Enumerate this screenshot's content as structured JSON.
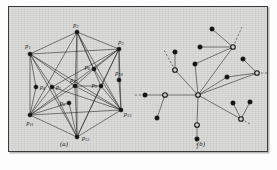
{
  "figure": {
    "background_color": "#fdfdfd",
    "plate_color": "#d4d4d2",
    "border_color": "#3a3a3a",
    "ink_color": "#141414",
    "panels": [
      {
        "id": "a",
        "caption": "(a)",
        "caption_x": 55,
        "caption_y": 139
      },
      {
        "id": "b",
        "caption": "(b)",
        "caption_x": 192,
        "caption_y": 139
      }
    ]
  },
  "chart_data": {
    "type": "diagram-graph",
    "title": "",
    "subtitle": "",
    "panels": [
      {
        "id": "a",
        "caption": "(a)",
        "description": "planar point set with complete-like visibility graph on thirteen labeled points",
        "node_count": 13,
        "node_style": "filled",
        "nodes": [
          {
            "id": "p1",
            "label": "p",
            "sub": "1",
            "x": 21,
            "y": 47,
            "label_dx": -2,
            "label_dy": -6,
            "anchor": "middle"
          },
          {
            "id": "p2",
            "label": "p",
            "sub": "2",
            "x": 68,
            "y": 25,
            "label_dx": -1,
            "label_dy": -5,
            "anchor": "middle"
          },
          {
            "id": "p3",
            "label": "p",
            "sub": "3",
            "x": 110,
            "y": 42,
            "label_dx": 2,
            "label_dy": -5,
            "anchor": "middle"
          },
          {
            "id": "p4",
            "label": "p",
            "sub": "4",
            "x": 27,
            "y": 80,
            "label_dx": 4,
            "label_dy": 2,
            "anchor": "start"
          },
          {
            "id": "p5",
            "label": "p",
            "sub": "5",
            "x": 43,
            "y": 80,
            "label_dx": 4,
            "label_dy": 2,
            "anchor": "start"
          },
          {
            "id": "p6",
            "label": "p",
            "sub": "6",
            "x": 60,
            "y": 96,
            "label_dx": -4,
            "label_dy": 2,
            "anchor": "end"
          },
          {
            "id": "p7",
            "label": "p",
            "sub": "7",
            "x": 66,
            "y": 79,
            "label_dx": -2,
            "label_dy": -4,
            "anchor": "middle"
          },
          {
            "id": "p8",
            "label": "p",
            "sub": "8",
            "x": 85,
            "y": 62,
            "label_dx": -4,
            "label_dy": 0,
            "anchor": "end"
          },
          {
            "id": "p9",
            "label": "p",
            "sub": "9",
            "x": 92,
            "y": 79,
            "label_dx": -4,
            "label_dy": 1,
            "anchor": "end"
          },
          {
            "id": "p10",
            "label": "p",
            "sub": "10",
            "x": 110,
            "y": 73,
            "label_dx": 0,
            "label_dy": -5,
            "anchor": "middle"
          },
          {
            "id": "p11",
            "label": "p",
            "sub": "11",
            "x": 21,
            "y": 108,
            "label_dx": 0,
            "label_dy": 10,
            "anchor": "middle"
          },
          {
            "id": "p12",
            "label": "p",
            "sub": "12",
            "x": 68,
            "y": 130,
            "label_dx": 5,
            "label_dy": 3,
            "anchor": "start"
          },
          {
            "id": "p13",
            "label": "p",
            "sub": "13",
            "x": 112,
            "y": 103,
            "label_dx": 3,
            "label_dy": 6,
            "anchor": "start"
          }
        ],
        "edges": [
          [
            "p1",
            "p2"
          ],
          [
            "p2",
            "p3"
          ],
          [
            "p1",
            "p11"
          ],
          [
            "p3",
            "p13"
          ],
          [
            "p11",
            "p12"
          ],
          [
            "p12",
            "p13"
          ],
          [
            "p1",
            "p3"
          ],
          [
            "p1",
            "p13"
          ],
          [
            "p2",
            "p11"
          ],
          [
            "p2",
            "p13"
          ],
          [
            "p3",
            "p11"
          ],
          [
            "p11",
            "p13"
          ],
          [
            "p2",
            "p12"
          ],
          [
            "p1",
            "p12"
          ],
          [
            "p3",
            "p12"
          ],
          [
            "p1",
            "p4"
          ],
          [
            "p4",
            "p11"
          ],
          [
            "p1",
            "p5"
          ],
          [
            "p5",
            "p11"
          ],
          [
            "p5",
            "p12"
          ],
          [
            "p5",
            "p13"
          ],
          [
            "p5",
            "p3"
          ],
          [
            "p7",
            "p11"
          ],
          [
            "p7",
            "p12"
          ],
          [
            "p7",
            "p13"
          ],
          [
            "p7",
            "p2"
          ],
          [
            "p7",
            "p1"
          ],
          [
            "p6",
            "p11"
          ],
          [
            "p6",
            "p12"
          ],
          [
            "p8",
            "p2"
          ],
          [
            "p8",
            "p3"
          ],
          [
            "p8",
            "p7"
          ],
          [
            "p8",
            "p13"
          ],
          [
            "p9",
            "p3"
          ],
          [
            "p9",
            "p7"
          ],
          [
            "p9",
            "p12"
          ],
          [
            "p9",
            "p13"
          ],
          [
            "p9",
            "p2"
          ],
          [
            "p10",
            "p3"
          ],
          [
            "p10",
            "p13"
          ]
        ]
      },
      {
        "id": "b",
        "caption": "(b)",
        "description": "sparse spanning tree with filled leaf nodes, hollow relay nodes and dashed continuation stubs",
        "node_count": 20,
        "node_styles": [
          "filled",
          "hollow"
        ],
        "nodes": [
          {
            "id": "b-hub",
            "style": "hollow",
            "x": 189,
            "y": 88
          },
          {
            "id": "b-n1",
            "style": "hollow",
            "x": 224,
            "y": 40
          },
          {
            "id": "b-n2",
            "style": "hollow",
            "x": 166,
            "y": 63
          },
          {
            "id": "b-n3",
            "style": "hollow",
            "x": 156,
            "y": 88
          },
          {
            "id": "b-n4",
            "style": "hollow",
            "x": 248,
            "y": 66
          },
          {
            "id": "b-n5",
            "style": "hollow",
            "x": 232,
            "y": 112
          },
          {
            "id": "b-n6",
            "style": "hollow",
            "x": 188,
            "y": 118
          },
          {
            "id": "b-l1",
            "style": "filled",
            "x": 203,
            "y": 22
          },
          {
            "id": "b-l2",
            "style": "filled",
            "x": 191,
            "y": 40
          },
          {
            "id": "b-l3",
            "style": "filled",
            "x": 166,
            "y": 45
          },
          {
            "id": "b-l4",
            "style": "filled",
            "x": 186,
            "y": 57
          },
          {
            "id": "b-l5",
            "style": "filled",
            "x": 234,
            "y": 52
          },
          {
            "id": "b-l6",
            "style": "filled",
            "x": 218,
            "y": 70
          },
          {
            "id": "b-l7",
            "style": "filled",
            "x": 224,
            "y": 96
          },
          {
            "id": "b-l8",
            "style": "filled",
            "x": 241,
            "y": 95
          },
          {
            "id": "b-l9",
            "style": "filled",
            "x": 136,
            "y": 88
          },
          {
            "id": "b-l10",
            "style": "filled",
            "x": 148,
            "y": 111
          },
          {
            "id": "b-l11",
            "style": "filled",
            "x": 188,
            "y": 132
          }
        ],
        "edges": [
          [
            "b-hub",
            "b-n1"
          ],
          [
            "b-hub",
            "b-n2"
          ],
          [
            "b-hub",
            "b-n3"
          ],
          [
            "b-hub",
            "b-n4"
          ],
          [
            "b-hub",
            "b-n5"
          ],
          [
            "b-hub",
            "b-n6"
          ],
          [
            "b-hub",
            "b-l4"
          ],
          [
            "b-hub",
            "b-l6"
          ],
          [
            "b-n1",
            "b-l1"
          ],
          [
            "b-n1",
            "b-l2"
          ],
          [
            "b-n1",
            "b-l4"
          ],
          [
            "b-n2",
            "b-l3"
          ],
          [
            "b-n3",
            "b-l9"
          ],
          [
            "b-n3",
            "b-l10"
          ],
          [
            "b-n4",
            "b-l5"
          ],
          [
            "b-n4",
            "b-l6"
          ],
          [
            "b-n5",
            "b-l7"
          ],
          [
            "b-n5",
            "b-l8"
          ],
          [
            "b-n6",
            "b-l11"
          ]
        ],
        "dashed_edges": [
          {
            "from": [
              224,
              40
            ],
            "to": [
              233,
              20
            ]
          },
          {
            "from": [
              166,
              63
            ],
            "to": [
              155,
              43
            ]
          },
          {
            "from": [
              136,
              88
            ],
            "to": [
              125,
              88
            ]
          },
          {
            "from": [
              248,
              66
            ],
            "to": [
              259,
              66
            ]
          },
          {
            "from": [
              232,
              112
            ],
            "to": [
              241,
              117
            ]
          },
          {
            "from": [
              188,
              132
            ],
            "to": [
              188,
              142
            ]
          }
        ]
      }
    ]
  }
}
